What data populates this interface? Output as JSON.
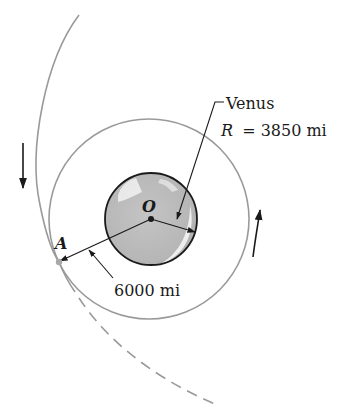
{
  "diagram": {
    "type": "orbital-mechanics-figure",
    "planet": {
      "name": "Venus",
      "radius_label": "R = 3850 mi",
      "radius_value": 3850,
      "unit": "mi",
      "center_label": "O"
    },
    "point": {
      "label": "A"
    },
    "dimension": {
      "label": "6000 mi",
      "value": 6000,
      "unit": "mi"
    },
    "labels": {
      "venus": "Venus",
      "radius_var": "R",
      "radius_eq": "= 3850 mi",
      "center": "O",
      "point_a": "A",
      "distance": "6000 mi"
    },
    "elements": {
      "circular_orbit": "circle through A centered at O",
      "approach_trajectory": "solid curve from top, tangent near A",
      "departure_trajectory": "dashed curve continuing past A",
      "motion_arrows": [
        "downward arrow on left (trajectory)",
        "upward arrow on right (circular orbit, counter-clockwise)"
      ]
    },
    "colors": {
      "orbit_line": "#9a9a9a",
      "planet_fill": "#bcbcbc",
      "planet_outline": "#1a1a1a",
      "ink": "#1a1a1a"
    }
  }
}
